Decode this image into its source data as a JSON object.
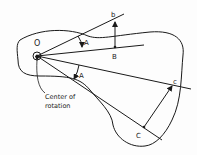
{
  "diagram": {
    "type": "rigid-body-rotation",
    "colors": {
      "stroke": "#1a1a1a",
      "background": "#fdfdfd"
    },
    "labels": {
      "center": "O",
      "angle_top": "A",
      "angle_bottom": "A",
      "point_B": "B",
      "point_b": "b",
      "point_C": "C",
      "point_c": "c",
      "caption_line1": "Center of",
      "caption_line2": "rotation"
    }
  }
}
